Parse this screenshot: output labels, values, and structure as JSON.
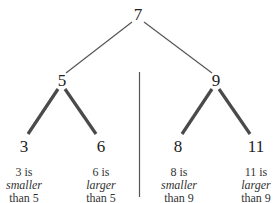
{
  "diagram": {
    "type": "binary-search-tree",
    "root": {
      "label": "7"
    },
    "level1": [
      {
        "label": "5"
      },
      {
        "label": "9"
      }
    ],
    "leaves": [
      {
        "label": "3",
        "caption": {
          "line1": "3 is",
          "line2": "smaller",
          "line3": "than 5"
        }
      },
      {
        "label": "6",
        "caption": {
          "line1": "6 is",
          "line2": "larger",
          "line3": "than 5"
        }
      },
      {
        "label": "8",
        "caption": {
          "line1": "8 is",
          "line2": "smaller",
          "line3": "than 9"
        }
      },
      {
        "label": "11",
        "caption": {
          "line1": "11 is",
          "line2": "larger",
          "line3": "than 9"
        }
      }
    ],
    "colors": {
      "thin_edge": "#555555",
      "thick_edge": "#4a4a4a",
      "divider": "#555555",
      "text": "#222222"
    }
  }
}
